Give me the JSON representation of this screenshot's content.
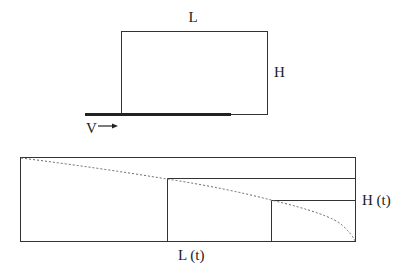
{
  "top_diagram": {
    "label_length": "L",
    "label_height": "H",
    "label_velocity": "V"
  },
  "bottom_diagram": {
    "label_height_t": "H (t)",
    "label_length_t": "L (t)"
  },
  "colors": {
    "line": "#333333",
    "dashed": "#666666"
  }
}
